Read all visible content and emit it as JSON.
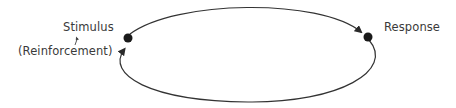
{
  "diagram": {
    "type": "stimulus-response-loop",
    "nodes": [
      {
        "id": "stimulus",
        "label": "Stimulus",
        "sublabel": "(Reinforcement)"
      },
      {
        "id": "response",
        "label": "Response"
      }
    ],
    "edges": [
      {
        "from": "stimulus",
        "to": "response",
        "path": "top-arc"
      },
      {
        "from": "response",
        "to": "stimulus",
        "path": "bottom-arc"
      }
    ],
    "colors": {
      "line": "#333333",
      "node": "#1a1a1a",
      "text": "#3a3a3a"
    }
  }
}
